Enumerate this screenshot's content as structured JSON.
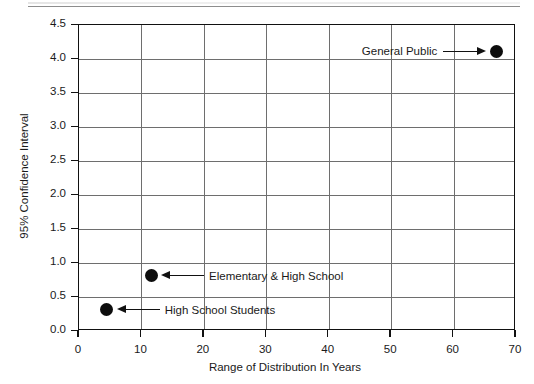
{
  "chart_data": {
    "type": "scatter",
    "title": "",
    "xlabel": "Range of Distribution In Years",
    "ylabel": "95% Confidence Interval",
    "xlim": [
      0,
      70
    ],
    "ylim": [
      0.0,
      4.5
    ],
    "xticks": [
      "0",
      "10",
      "20",
      "30",
      "40",
      "50",
      "60",
      "70"
    ],
    "yticks": [
      "0.0",
      "0.5",
      "1.0",
      "1.5",
      "2.0",
      "2.5",
      "3.0",
      "3.5",
      "4.0",
      "4.5"
    ],
    "grid": true,
    "legend": "none",
    "points": [
      {
        "label": "General Public",
        "x": 67,
        "y": 4.1,
        "annotation_side": "left",
        "arrow": "right"
      },
      {
        "label": "Elementary & High School",
        "x": 11.7,
        "y": 0.8,
        "annotation_side": "right",
        "arrow": "left"
      },
      {
        "label": "High School Students",
        "x": 4.6,
        "y": 0.3,
        "annotation_side": "right",
        "arrow": "left"
      }
    ],
    "colors": {
      "marker": "#0d0d0d",
      "grid": "#6e6e6e",
      "axis": "#111111",
      "background": "#ffffff"
    }
  }
}
